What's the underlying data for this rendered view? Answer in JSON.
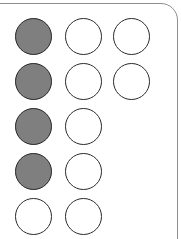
{
  "panel": {
    "name": "dot-matrix-panel",
    "shape": "rounded-rectangle-card",
    "background_color": "#ffffff",
    "border_color": "#8e8e8e",
    "corner_radius_px": 17,
    "cropped_edges": "left and bottom edges extend beyond the screenshot"
  },
  "legend": {
    "filled_color": "#7f7f7f",
    "empty_color": "#ffffff",
    "outline_color": "#2b2b2b"
  },
  "counts": {
    "total_dots": 12,
    "filled_dots": 4,
    "empty_dots": 8,
    "rows": 5,
    "columns": 3
  },
  "grid": {
    "rows": [
      {
        "index": 0,
        "top": 18,
        "dots": [
          {
            "column": 0,
            "state": "filled",
            "label": "dot-r1-c1"
          },
          {
            "column": 1,
            "state": "empty",
            "label": "dot-r1-c2"
          },
          {
            "column": 2,
            "state": "empty",
            "label": "dot-r1-c3"
          }
        ]
      },
      {
        "index": 1,
        "top": 63,
        "dots": [
          {
            "column": 0,
            "state": "filled",
            "label": "dot-r2-c1"
          },
          {
            "column": 1,
            "state": "empty",
            "label": "dot-r2-c2"
          },
          {
            "column": 2,
            "state": "empty",
            "label": "dot-r2-c3"
          }
        ]
      },
      {
        "index": 2,
        "top": 108,
        "dots": [
          {
            "column": 0,
            "state": "filled",
            "label": "dot-r3-c1"
          },
          {
            "column": 1,
            "state": "empty",
            "label": "dot-r3-c2"
          }
        ]
      },
      {
        "index": 3,
        "top": 153,
        "dots": [
          {
            "column": 0,
            "state": "filled",
            "label": "dot-r4-c1"
          },
          {
            "column": 1,
            "state": "empty",
            "label": "dot-r4-c2"
          }
        ]
      },
      {
        "index": 4,
        "top": 198,
        "dots": [
          {
            "column": 0,
            "state": "empty",
            "label": "dot-r5-c1"
          },
          {
            "column": 1,
            "state": "empty",
            "label": "dot-r5-c2"
          }
        ]
      }
    ]
  }
}
